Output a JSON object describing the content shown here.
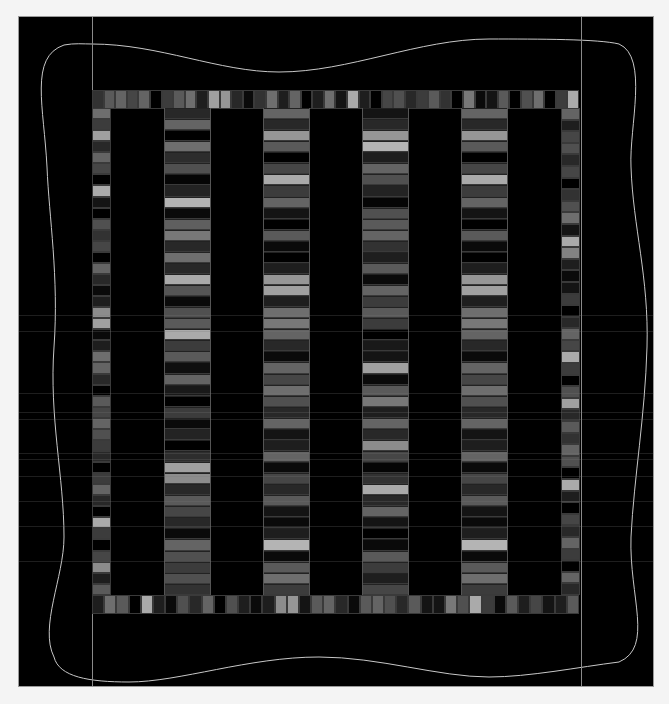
{
  "diagram": {
    "background_color": "#f4f4f4",
    "field_color": "#000000",
    "outline_color": "#b8b8b8",
    "guide_lines_x": [
      73,
      562
    ],
    "columns": [
      {
        "x": 145,
        "top": 91,
        "height": 487,
        "shades": [
          40,
          100,
          0,
          110,
          45,
          80,
          5,
          35,
          180,
          10,
          95,
          120,
          40,
          110,
          40,
          170,
          85,
          10,
          80,
          90,
          170,
          60,
          90,
          15,
          100,
          25,
          0,
          60,
          10,
          35,
          0,
          45,
          160,
          140,
          40,
          90,
          70,
          40,
          10,
          100,
          80,
          60,
          80,
          50
        ]
      },
      {
        "x": 244,
        "top": 91,
        "height": 487,
        "shades": [
          100,
          40,
          150,
          90,
          0,
          70,
          170,
          60,
          100,
          20,
          0,
          90,
          10,
          0,
          30,
          150,
          160,
          30,
          110,
          120,
          100,
          40,
          10,
          100,
          70,
          110,
          80,
          40,
          100,
          20,
          30,
          100,
          10,
          70,
          40,
          90,
          20,
          10,
          30,
          180,
          10,
          90,
          110,
          60
        ]
      },
      {
        "x": 343,
        "top": 91,
        "height": 487,
        "shades": [
          20,
          40,
          150,
          180,
          30,
          100,
          80,
          35,
          5,
          80,
          90,
          100,
          50,
          30,
          90,
          10,
          100,
          60,
          90,
          60,
          0,
          25,
          20,
          160,
          10,
          90,
          120,
          30,
          100,
          40,
          140,
          70,
          5,
          50,
          170,
          40,
          100,
          20,
          0,
          10,
          90,
          60,
          30,
          70
        ]
      },
      {
        "x": 442,
        "top": 91,
        "height": 487,
        "shades": [
          100,
          40,
          150,
          90,
          0,
          70,
          170,
          60,
          100,
          20,
          0,
          90,
          10,
          0,
          30,
          150,
          160,
          30,
          110,
          120,
          100,
          40,
          10,
          100,
          70,
          110,
          80,
          40,
          100,
          20,
          30,
          100,
          10,
          70,
          40,
          90,
          20,
          10,
          30,
          180,
          10,
          90,
          110,
          60
        ]
      }
    ],
    "border_top": {
      "x": 73,
      "y": 73,
      "width": 487,
      "shades": [
        50,
        90,
        100,
        70,
        100,
        0,
        60,
        90,
        110,
        30,
        160,
        150,
        40,
        10,
        50,
        110,
        30,
        100,
        0,
        30,
        110,
        20,
        170,
        30,
        0,
        70,
        80,
        40,
        60,
        90,
        50,
        0,
        120,
        10,
        20,
        90,
        0,
        80,
        110,
        0,
        60,
        170
      ]
    },
    "border_bottom": {
      "x": 73,
      "y": 578,
      "width": 487,
      "shades": [
        30,
        110,
        90,
        0,
        170,
        30,
        10,
        80,
        40,
        100,
        0,
        80,
        30,
        10,
        30,
        140,
        150,
        20,
        90,
        100,
        40,
        10,
        90,
        100,
        80,
        40,
        90,
        20,
        20,
        120,
        80,
        170,
        60,
        10,
        90,
        30,
        70,
        20,
        30,
        90
      ]
    },
    "border_left": {
      "x": 73,
      "y": 91,
      "height": 487,
      "shades": [
        110,
        60,
        160,
        40,
        100,
        70,
        0,
        170,
        20,
        0,
        80,
        50,
        70,
        0,
        100,
        40,
        10,
        30,
        140,
        160,
        10,
        30,
        110,
        100,
        40,
        0,
        90,
        70,
        100,
        80,
        60,
        40,
        0,
        60,
        100,
        40,
        0,
        170,
        60,
        0,
        70,
        140,
        30,
        90
      ]
    },
    "border_right": {
      "x": 542,
      "y": 91,
      "height": 487,
      "shades": [
        100,
        30,
        70,
        80,
        40,
        70,
        0,
        50,
        80,
        110,
        20,
        170,
        130,
        30,
        10,
        20,
        60,
        0,
        40,
        100,
        70,
        170,
        60,
        0,
        80,
        160,
        40,
        90,
        50,
        100,
        80,
        0,
        170,
        30,
        0,
        70,
        40,
        100,
        60,
        0,
        100,
        40
      ]
    },
    "streaks_y": [
      314,
      330,
      392,
      411,
      418,
      452,
      458,
      475,
      500,
      525,
      560
    ]
  }
}
